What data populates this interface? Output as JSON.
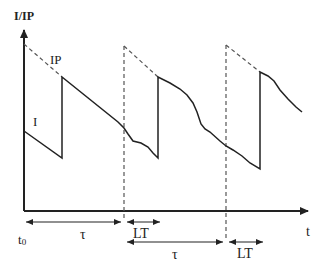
{
  "diagram": {
    "type": "sawtooth-timing-diagram",
    "y_axis_label": "I/IP",
    "x_axis_label": "t",
    "curve_labels": {
      "envelope": "IP",
      "signal": "I"
    },
    "time_labels": {
      "origin": "t0",
      "origin_main": "t",
      "origin_sub": "0",
      "period": "τ",
      "lead_time": "LT"
    },
    "intervals": [
      {
        "name": "tau-1",
        "label": "τ",
        "row": 1
      },
      {
        "name": "lt-1",
        "label": "LT",
        "row": 1
      },
      {
        "name": "tau-2",
        "label": "τ",
        "row": 2
      },
      {
        "name": "lt-2",
        "label": "LT",
        "row": 2
      }
    ],
    "colors": {
      "line": "#222222",
      "dashed": "#555555",
      "background": "#ffffff"
    }
  }
}
